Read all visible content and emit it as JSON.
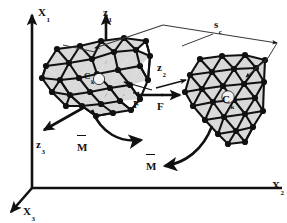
{
  "figure": {
    "background_color": "#ffffff",
    "ink_color": "#111111",
    "mesh_fill_color": "#d9d9d9",
    "width": 287,
    "height": 223
  },
  "axes": {
    "global": {
      "frame_label": "X",
      "items": [
        {
          "name": "X1",
          "base": "X",
          "sub": "1",
          "direction": "up",
          "x": 38,
          "y": 3
        },
        {
          "name": "X2",
          "base": "X",
          "sub": "2",
          "direction": "right-horizontal",
          "x": 272,
          "y": 176
        },
        {
          "name": "X3",
          "base": "X",
          "sub": "3",
          "direction": "down-left",
          "x": 23,
          "y": 202
        }
      ]
    },
    "local": {
      "frame_label": "z",
      "items": [
        {
          "name": "z1",
          "base": "z",
          "sub": "1",
          "direction": "up",
          "x": 103,
          "y": 3
        },
        {
          "name": "z2",
          "base": "z",
          "sub": "2",
          "direction": "right",
          "x": 157,
          "y": 58
        },
        {
          "name": "z3",
          "base": "z",
          "sub": "3",
          "direction": "down-left",
          "x": 36,
          "y": 135
        }
      ]
    }
  },
  "vectors": {
    "force_left": {
      "base": "F",
      "accent": "arrow",
      "x": 133,
      "y": 95
    },
    "force_right": {
      "base": "F",
      "accent": "arrow",
      "x": 157,
      "y": 97
    },
    "moment_upper": {
      "base": "M",
      "accent": "bar",
      "x": 77,
      "y": 138
    },
    "moment_lower": {
      "base": "M",
      "accent": "bar",
      "x": 146,
      "y": 157
    }
  },
  "separation": {
    "base": "s",
    "sub": "c",
    "x": 214,
    "y": 15,
    "description": "contact separation vector, double-headed arrow spanning the two bodies"
  },
  "bodies": [
    {
      "name": "body-left",
      "center_label": {
        "base": "C",
        "sub": "k",
        "x": 84,
        "y": 72
      },
      "mesh_type": "triangulated"
    },
    {
      "name": "body-right",
      "center_label": {
        "base": "C",
        "sub": "k",
        "x": 228,
        "y": 92
      },
      "mesh_type": "triangulated"
    }
  ]
}
